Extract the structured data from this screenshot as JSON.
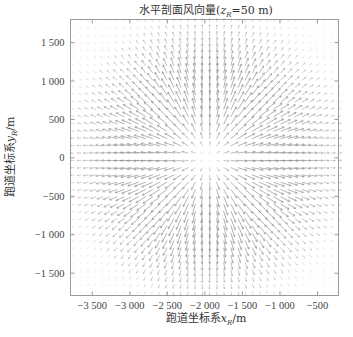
{
  "chart_data": {
    "type": "quiver",
    "title_parts": {
      "prefix": "水平剖面风向量(",
      "var": "z",
      "sub": "R",
      "suffix": "=50 m)"
    },
    "xlabel": "跑道坐标系x_R/m",
    "xlabel_parts": {
      "prefix": "跑道坐标系",
      "var": "x",
      "sub": "R",
      "suffix": "/m"
    },
    "ylabel": "跑道坐标系y_R/m",
    "ylabel_parts": {
      "prefix": "跑道坐标系",
      "var": "y",
      "sub": "R",
      "suffix": "/m"
    },
    "xlim": [
      -3790,
      -220
    ],
    "ylim": [
      -1790,
      1800
    ],
    "xticks": [
      -3500,
      -3000,
      -2500,
      -2000,
      -1500,
      -1000,
      -500
    ],
    "xtick_labels": [
      "−3 500",
      "−3 000",
      "−2 500",
      "−2 000",
      "−1 500",
      "−1 000",
      "−500"
    ],
    "yticks": [
      1500,
      1000,
      500,
      0,
      -500,
      -1000,
      -1500
    ],
    "ytick_labels": [
      "1 500",
      "1 000",
      "500",
      "0",
      "−500",
      "−1 000",
      "−1 500"
    ],
    "field": {
      "pattern": "divergent outflow (microburst)",
      "center": [
        -1960,
        0
      ],
      "grid_spacing": 95,
      "peak_radius": 1100,
      "color": "#8c8c8c"
    },
    "grid": false,
    "legend": "none"
  }
}
